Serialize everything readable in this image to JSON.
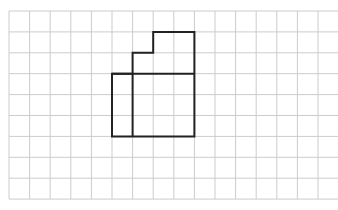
{
  "diagram": {
    "type": "grid-figure",
    "grid": {
      "columns": 16,
      "rows": 9,
      "origin_x": 9,
      "origin_y": 11,
      "cell_width": 20.6,
      "cell_height": 20.9,
      "line_color": "#cccccc",
      "line_width": 1
    },
    "shape": {
      "stroke_color": "#222222",
      "stroke_width": 2,
      "outline_cells": [
        [
          7,
          1
        ],
        [
          9,
          1
        ],
        [
          9,
          6
        ],
        [
          5,
          6
        ],
        [
          5,
          3
        ],
        [
          6,
          3
        ],
        [
          6,
          2
        ],
        [
          7,
          2
        ]
      ],
      "interior_segments": [
        {
          "from": [
            5,
            3
          ],
          "to": [
            9,
            3
          ]
        },
        {
          "from": [
            6,
            3
          ],
          "to": [
            6,
            6
          ]
        }
      ]
    }
  }
}
